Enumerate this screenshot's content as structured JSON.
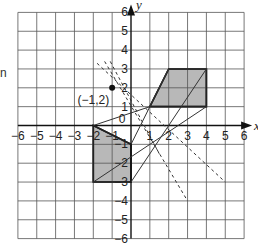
{
  "fragment_text": "n",
  "axes": {
    "x_label": "x",
    "y_label": "y",
    "origin_label": "0",
    "x_ticks": [
      "-6",
      "-5",
      "-4",
      "-3",
      "-2",
      "-1",
      "1",
      "2",
      "3",
      "4",
      "5",
      "6"
    ],
    "y_ticks": [
      "6",
      "5",
      "4",
      "3",
      "2",
      "1",
      "-1",
      "-2",
      "-3",
      "-4",
      "-5",
      "-6"
    ],
    "range": {
      "xmin": -6,
      "xmax": 6,
      "ymin": -6,
      "ymax": 6
    }
  },
  "point": {
    "label": "(−1,2)",
    "x": -1,
    "y": 2
  },
  "shapes": {
    "object": {
      "vertices": [
        [
          -2,
          0
        ],
        [
          0,
          -1
        ],
        [
          0,
          -3
        ],
        [
          -2,
          -3
        ]
      ],
      "fill": "#b8b8b8"
    },
    "image": {
      "vertices": [
        [
          1,
          1
        ],
        [
          2,
          3
        ],
        [
          4,
          3
        ],
        [
          4,
          1
        ]
      ],
      "fill": "#b8b8b8"
    }
  },
  "solid_lines": [
    [
      [
        -2,
        0
      ],
      [
        1,
        1
      ]
    ],
    [
      [
        0,
        -1
      ],
      [
        2,
        3
      ]
    ],
    [
      [
        -2,
        -3
      ],
      [
        4,
        1
      ]
    ],
    [
      [
        0,
        -3
      ],
      [
        4,
        3
      ]
    ]
  ],
  "dashed_lines": [
    [
      [
        -1.8,
        3.3
      ],
      [
        5,
        -3
      ]
    ],
    [
      [
        -1.4,
        3.4
      ],
      [
        3,
        -4
      ]
    ],
    [
      [
        -1.1,
        3.4
      ],
      [
        1.5,
        -1.5
      ]
    ]
  ],
  "colors": {
    "grid": "#555555",
    "axis": "#111111",
    "shape_fill": "#b8b8b8",
    "line": "#333333"
  }
}
